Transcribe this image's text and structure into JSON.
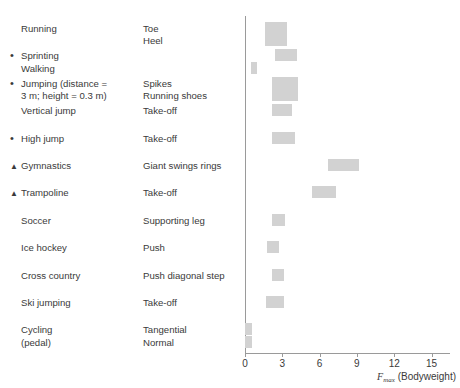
{
  "chart_data": {
    "type": "bar",
    "orientation": "horizontal-range",
    "title": "",
    "xlabel": "Fmax (Bodyweight)",
    "ylabel": "",
    "xlim": [
      0,
      16.5
    ],
    "ticks": [
      0,
      3,
      6,
      9,
      12,
      15
    ],
    "tick_labels": [
      "0",
      "3",
      "6",
      "9",
      "12",
      "15"
    ],
    "grid": false,
    "legend": "none",
    "bar_color": "#d2d2d2",
    "axis_color": "#9a9a9a",
    "rows": [
      {
        "marker": "",
        "activity": "Running",
        "activity_sub": "",
        "phase": "Toe",
        "phase_sub": "Heel",
        "bars": [
          {
            "phase": "Toe",
            "low": 1.6,
            "high": 3.4
          },
          {
            "phase": "Heel",
            "low": 1.6,
            "high": 3.4
          }
        ]
      },
      {
        "marker": "dot",
        "activity": "Sprinting",
        "activity_sub": "Walking",
        "phase": "",
        "phase_sub": "",
        "bars": [
          {
            "phase": "Sprinting",
            "low": 2.4,
            "high": 4.2
          },
          {
            "phase": "Walking",
            "low": 0.5,
            "high": 1.0
          }
        ]
      },
      {
        "marker": "dot",
        "activity": "Jumping (distance =",
        "activity_sub": "3 m; height = 0.3 m)",
        "phase": "Spikes",
        "phase_sub": "Running shoes",
        "bars": [
          {
            "phase": "Spikes",
            "low": 2.2,
            "high": 4.3
          },
          {
            "phase": "Running shoes",
            "low": 2.2,
            "high": 4.3
          }
        ]
      },
      {
        "marker": "",
        "activity": "Vertical jump",
        "activity_sub": "",
        "phase": "Take-off",
        "phase_sub": "",
        "bars": [
          {
            "phase": "Take-off",
            "low": 2.2,
            "high": 3.8
          }
        ]
      },
      {
        "marker": "dot",
        "activity": "High jump",
        "activity_sub": "",
        "phase": "Take-off",
        "phase_sub": "",
        "bars": [
          {
            "phase": "Take-off",
            "low": 2.2,
            "high": 4.0
          }
        ]
      },
      {
        "marker": "tri",
        "activity": "Gymnastics",
        "activity_sub": "",
        "phase": "Giant swings rings",
        "phase_sub": "",
        "bars": [
          {
            "phase": "Giant swings rings",
            "low": 6.7,
            "high": 9.2
          }
        ]
      },
      {
        "marker": "tri",
        "activity": "Trampoline",
        "activity_sub": "",
        "phase": "Take-off",
        "phase_sub": "",
        "bars": [
          {
            "phase": "Take-off",
            "low": 5.4,
            "high": 7.3
          }
        ]
      },
      {
        "marker": "",
        "activity": "Soccer",
        "activity_sub": "",
        "phase": "Supporting leg",
        "phase_sub": "",
        "bars": [
          {
            "phase": "Supporting leg",
            "low": 2.2,
            "high": 3.2
          }
        ]
      },
      {
        "marker": "",
        "activity": "Ice hockey",
        "activity_sub": "",
        "phase": "Push",
        "phase_sub": "",
        "bars": [
          {
            "phase": "Push",
            "low": 1.8,
            "high": 2.7
          }
        ]
      },
      {
        "marker": "",
        "activity": "Cross country",
        "activity_sub": "",
        "phase": "Push diagonal step",
        "phase_sub": "",
        "bars": [
          {
            "phase": "Push diagonal step",
            "low": 2.2,
            "high": 3.1
          }
        ]
      },
      {
        "marker": "",
        "activity": "Ski jumping",
        "activity_sub": "",
        "phase": "Take-off",
        "phase_sub": "",
        "bars": [
          {
            "phase": "Take-off",
            "low": 1.7,
            "high": 3.1
          }
        ]
      },
      {
        "marker": "",
        "activity": "Cycling",
        "activity_sub": "(pedal)",
        "phase": "Tangential",
        "phase_sub": "Normal",
        "bars": [
          {
            "phase": "Tangential",
            "low": 0.0,
            "high": 0.55
          },
          {
            "phase": "Normal",
            "low": 0.0,
            "high": 0.55
          }
        ]
      }
    ]
  },
  "axis": {
    "x_title_symbol": "F",
    "x_title_sub": "max",
    "x_title_rest": " (Bodyweight)"
  }
}
